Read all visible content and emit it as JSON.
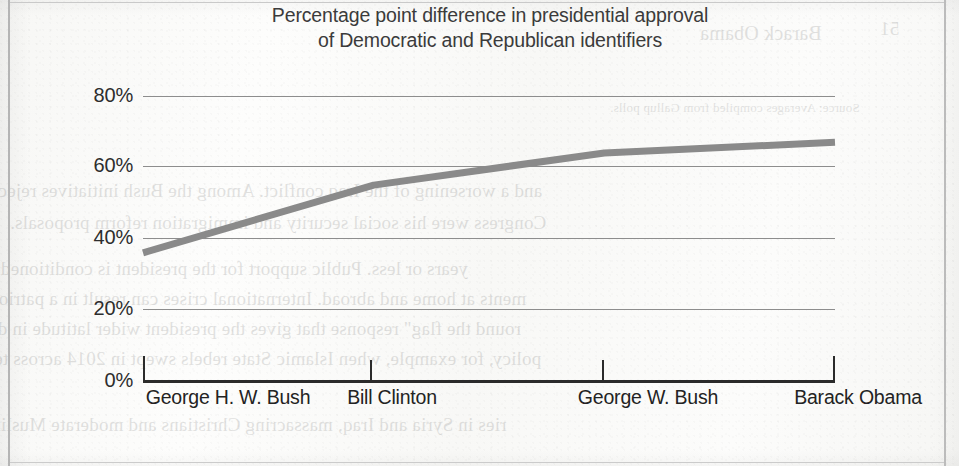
{
  "chart_data": {
    "type": "line",
    "title": "Percentage point difference in presidential approval of Democratic and Republican identifiers",
    "title_lines": [
      "Percentage point difference in presidential approval",
      "of Democratic and Republican identifiers"
    ],
    "categories": [
      "George H. W. Bush",
      "Bill Clinton",
      "George W. Bush",
      "Barack Obama"
    ],
    "values": [
      36,
      55,
      64,
      67
    ],
    "value_labels": [
      "36%",
      "55%",
      "64%",
      "67%"
    ],
    "xlabel": "",
    "ylabel": "",
    "ylim": [
      0,
      80
    ],
    "y_ticks": [
      0,
      20,
      40,
      60,
      80
    ],
    "y_tick_labels": [
      "0%",
      "20%",
      "40%",
      "60%",
      "80%"
    ],
    "grid": true,
    "grid_axis": "y",
    "legend": false,
    "legend_position": "none",
    "series_color": "#8a8a8a",
    "axis_color": "#2b2b2b",
    "gridline_color": "#8d8d8d",
    "title_color": "#3b3b3b",
    "background_color": "#fbfbfa",
    "series": [
      {
        "name": "Percentage point difference in approval",
        "values": [
          36,
          55,
          64,
          67
        ]
      }
    ]
  },
  "bleed_through_text": {
    "note": "mirrored ink show-through from the reverse side of the scanned page",
    "lines": [
      "Barack Obama",
      "51",
      "Source: Averages compiled from Gallup polls.",
      "and a worsening of the Iraq conflict. Among the Bush initiatives rejected b",
      "Congress were his social security and immigration reform proposals.",
      "years or less.   Public support for the president is conditioned by develop",
      "ments at home and abroad. International crises can result in a patriotic \"rall",
      "round the flag\" response that gives the president wider latitude in decidin",
      "policy, for example, when Islamic State rebels swept in 2014 across territ",
      "ries in Syria and Iraq, massacring Christians and moderate Muslims an"
    ]
  }
}
